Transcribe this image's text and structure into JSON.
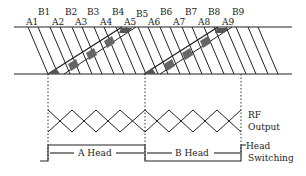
{
  "diagram": {
    "track_labels_b": [
      "B1",
      "B2",
      "B3",
      "B4",
      "B5",
      "B6",
      "B7",
      "B8",
      "B9"
    ],
    "track_labels_a": [
      "A1",
      "A2",
      "A3",
      "A4",
      "A5",
      "A6",
      "A7",
      "A8",
      "A9"
    ],
    "rf_output_label_line1": "RF",
    "rf_output_label_line2": "Output",
    "head_switching_label_line1": "Head",
    "head_switching_label_line2": "Switching",
    "a_head_label": "A Head",
    "b_head_label": "B Head",
    "colors": {
      "line": "#222222",
      "shaded_block": "#555555",
      "background": "#ffffff"
    }
  }
}
